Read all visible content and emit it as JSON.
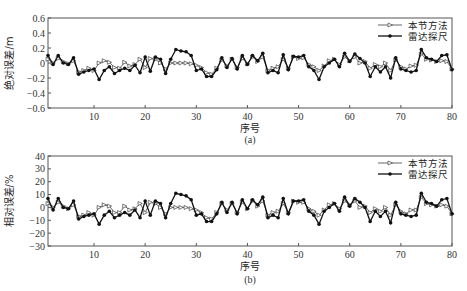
{
  "chart_data": [
    {
      "type": "line",
      "panel_label": "(a)",
      "xlabel": "序号",
      "ylabel": "绝对误差/m",
      "xlim": [
        1,
        80
      ],
      "ylim": [
        -0.6,
        0.6
      ],
      "xticks": [
        10,
        20,
        30,
        40,
        50,
        60,
        70,
        80
      ],
      "yticks": [
        0.6,
        0.4,
        0.2,
        0,
        -0.2,
        -0.4,
        -0.6
      ],
      "ytick_labels": [
        "0.6",
        "0.4",
        "0.2",
        "0",
        "-0.2",
        "-0.4",
        "-0.6"
      ],
      "legend_position": "upper right",
      "grid": false,
      "series": [
        {
          "name": "本节方法",
          "marker": "triangle-right-hollow",
          "values": [
            0.05,
            0.0,
            0.06,
            0.02,
            -0.01,
            0.03,
            -0.12,
            -0.1,
            -0.07,
            -0.1,
            0.0,
            0.03,
            0.01,
            -0.06,
            -0.07,
            0.01,
            -0.04,
            -0.02,
            0.05,
            -0.06,
            0.06,
            0.05,
            0.0,
            -0.08,
            0.0,
            0.0,
            0.0,
            0.0,
            -0.01,
            -0.03,
            -0.06,
            -0.13,
            -0.15,
            -0.07,
            0.04,
            -0.04,
            0.05,
            -0.06,
            0.06,
            -0.01,
            0.08,
            0.02,
            0.08,
            -0.1,
            -0.07,
            -0.05,
            0.05,
            -0.07,
            0.08,
            0.06,
            0.07,
            -0.02,
            -0.05,
            -0.1,
            -0.04,
            0.03,
            0.05,
            -0.02,
            0.08,
            0.03,
            0.08,
            0.0,
            0.02,
            -0.07,
            -0.02,
            -0.05,
            0.0,
            -0.1,
            0.04,
            -0.05,
            -0.08,
            -0.04,
            -0.03,
            0.12,
            0.05,
            0.04,
            0.02,
            0.03,
            0.02,
            -0.08
          ]
        },
        {
          "name": "雷达探尺",
          "marker": "asterisk-filled",
          "values": [
            0.1,
            -0.02,
            0.1,
            0.0,
            -0.02,
            0.07,
            -0.15,
            -0.12,
            -0.1,
            -0.08,
            -0.22,
            -0.1,
            -0.05,
            -0.14,
            -0.1,
            -0.07,
            -0.1,
            -0.03,
            -0.13,
            0.08,
            -0.11,
            0.08,
            0.05,
            -0.14,
            0.05,
            0.18,
            0.16,
            0.15,
            0.1,
            -0.1,
            -0.08,
            -0.18,
            -0.18,
            -0.09,
            0.07,
            -0.06,
            0.06,
            -0.08,
            0.1,
            -0.02,
            0.1,
            0.03,
            0.13,
            -0.13,
            -0.1,
            -0.13,
            0.11,
            -0.09,
            0.09,
            0.08,
            0.1,
            -0.05,
            -0.1,
            -0.22,
            -0.05,
            0.0,
            0.05,
            -0.05,
            0.13,
            0.02,
            0.12,
            0.06,
            0.0,
            -0.18,
            -0.05,
            -0.12,
            -0.05,
            -0.2,
            0.07,
            -0.08,
            -0.1,
            -0.12,
            -0.1,
            0.18,
            0.07,
            0.05,
            0.02,
            0.1,
            0.11,
            -0.09
          ]
        }
      ]
    },
    {
      "type": "line",
      "panel_label": "(b)",
      "xlabel": "序号",
      "ylabel": "相对误差/%",
      "xlim": [
        1,
        80
      ],
      "ylim": [
        -30,
        40
      ],
      "xticks": [
        10,
        20,
        30,
        40,
        50,
        60,
        70,
        80
      ],
      "yticks": [
        40,
        30,
        20,
        10,
        0,
        -10,
        -20,
        -30
      ],
      "ytick_labels": [
        "40",
        "30",
        "20",
        "10",
        "0",
        "-10",
        "-20",
        "-30"
      ],
      "legend_position": "upper right",
      "grid": false,
      "series": [
        {
          "name": "本节方法",
          "marker": "triangle-right-hollow",
          "values": [
            3,
            0,
            4,
            1,
            -1,
            2,
            -7,
            -6,
            -4,
            -6,
            0,
            2,
            1,
            -4,
            -4,
            1,
            -2,
            -1,
            3,
            -4,
            4,
            3,
            0,
            -5,
            0,
            0,
            0,
            0,
            -1,
            -2,
            -4,
            -8,
            -9,
            -4,
            3,
            -2,
            3,
            -4,
            4,
            -1,
            5,
            1,
            5,
            -6,
            -4,
            -3,
            3,
            -4,
            5,
            4,
            4,
            -1,
            -3,
            -6,
            -2,
            2,
            3,
            -1,
            5,
            2,
            5,
            0,
            1,
            -4,
            -1,
            -3,
            0,
            -6,
            2,
            -3,
            -5,
            -2,
            -2,
            8,
            3,
            2,
            1,
            2,
            1,
            -5
          ]
        },
        {
          "name": "雷达探尺",
          "marker": "asterisk-filled",
          "values": [
            7,
            -2,
            7,
            0,
            -1,
            5,
            -9,
            -7,
            -6,
            -5,
            -13,
            -6,
            -3,
            -8,
            -6,
            -4,
            -6,
            -2,
            -8,
            5,
            -6,
            5,
            3,
            -8,
            3,
            11,
            10,
            9,
            6,
            -6,
            -5,
            -11,
            -11,
            -5,
            4,
            -4,
            4,
            -5,
            6,
            -1,
            6,
            2,
            8,
            -8,
            -6,
            -8,
            7,
            -5,
            5,
            5,
            6,
            -3,
            -6,
            -13,
            -3,
            0,
            3,
            -3,
            8,
            1,
            7,
            4,
            0,
            -11,
            -3,
            -7,
            -3,
            -12,
            4,
            -5,
            -6,
            -7,
            -6,
            11,
            4,
            3,
            1,
            6,
            7,
            -5
          ]
        }
      ]
    }
  ]
}
